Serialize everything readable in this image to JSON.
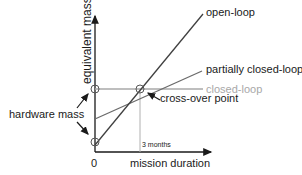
{
  "diagram": {
    "y_axis_label": "equivalent mass",
    "x_axis_label": "mission duration",
    "origin_label": "0",
    "tick_label": "3 months",
    "hardware_label": "hardware mass",
    "crossover_label": "cross-over point",
    "series": [
      {
        "name": "open-loop",
        "color": "#404040"
      },
      {
        "name": "partially closed-loop",
        "color": "#6a6a6a"
      },
      {
        "name": "closed-loop",
        "color": "#a8a8a8"
      }
    ]
  }
}
